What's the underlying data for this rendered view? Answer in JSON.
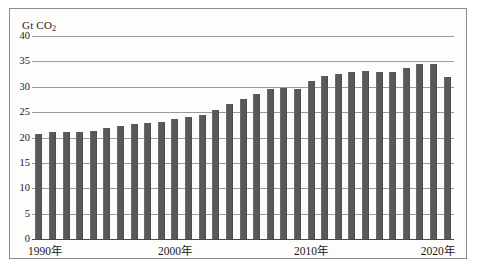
{
  "chart_data": {
    "type": "bar",
    "title": "",
    "subtitle": "",
    "xlabel": "",
    "ylabel": "Gt CO2",
    "ylabel_display": "Gt CO",
    "ylabel_subscript": "2",
    "ylim": [
      0,
      40
    ],
    "ytick_values": [
      0,
      5,
      10,
      15,
      20,
      25,
      30,
      35,
      40
    ],
    "ytick_labels": [
      "0",
      "5",
      "10",
      "15",
      "20",
      "25",
      "30",
      "35",
      "40"
    ],
    "grid": true,
    "legend": false,
    "legend_position": "none",
    "bar_color": "#595959",
    "categories": [
      "1990",
      "1991",
      "1992",
      "1993",
      "1994",
      "1995",
      "1996",
      "1997",
      "1998",
      "1999",
      "2000",
      "2001",
      "2002",
      "2003",
      "2004",
      "2005",
      "2006",
      "2007",
      "2008",
      "2009",
      "2010",
      "2011",
      "2012",
      "2013",
      "2014",
      "2015",
      "2016",
      "2017",
      "2018",
      "2019",
      "2020"
    ],
    "values": [
      20.7,
      21.0,
      21.0,
      21.0,
      21.2,
      21.8,
      22.2,
      22.6,
      22.8,
      23.0,
      23.7,
      24.1,
      24.5,
      25.4,
      26.6,
      27.6,
      28.6,
      29.6,
      29.7,
      29.5,
      31.1,
      32.1,
      32.5,
      32.9,
      33.1,
      32.9,
      33.0,
      33.6,
      34.4,
      34.4,
      32.0
    ],
    "xtick_labels": [
      "1990年",
      "2000年",
      "2010年",
      "2020年"
    ],
    "xtick_categories": [
      "1990",
      "2000",
      "2010",
      "2020"
    ]
  }
}
